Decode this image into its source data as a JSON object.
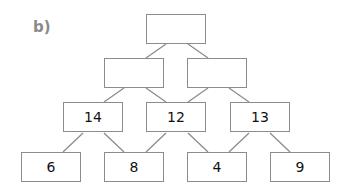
{
  "label": "b)",
  "pyramid": {
    "rows": [
      [
        ""
      ],
      [
        "",
        ""
      ],
      [
        "14",
        "12",
        "13"
      ],
      [
        "6",
        "8",
        "4",
        "9"
      ]
    ]
  },
  "colors": {
    "border": "#8c8c8c",
    "label": "#8a8a8a",
    "text": "#111111"
  }
}
